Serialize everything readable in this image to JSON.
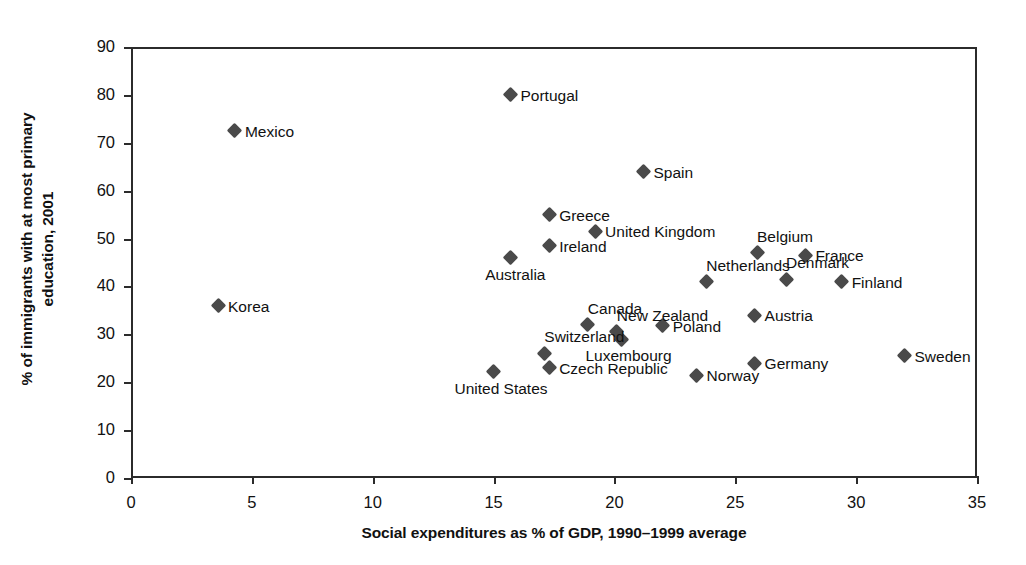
{
  "chart_data": {
    "type": "scatter",
    "title": "",
    "xlabel": "Social expenditures as % of GDP, 1990–1999 average",
    "ylabel": "% of immigrants with at most primary\neducation, 2001",
    "xlim": [
      0,
      35
    ],
    "ylim": [
      0,
      90
    ],
    "xticks": [
      "0",
      "5",
      "10",
      "15",
      "20",
      "25",
      "30",
      "35"
    ],
    "yticks": [
      "0",
      "10",
      "20",
      "30",
      "40",
      "50",
      "60",
      "70",
      "80",
      "90"
    ],
    "xtick_step": 5,
    "ytick_step": 10,
    "grid": false,
    "legend": "none",
    "marker_color": "#4a4a4a",
    "axis_color": "#2b2b2b",
    "points": [
      {
        "label": "Portugal",
        "x": 15.7,
        "y": 80.0,
        "label_pos": "right"
      },
      {
        "label": "Mexico",
        "x": 4.3,
        "y": 72.5,
        "label_pos": "right"
      },
      {
        "label": "Spain",
        "x": 21.2,
        "y": 64.0,
        "label_pos": "right"
      },
      {
        "label": "Greece",
        "x": 17.3,
        "y": 55.0,
        "label_pos": "right"
      },
      {
        "label": "United Kingdom",
        "x": 19.2,
        "y": 51.5,
        "label_pos": "right"
      },
      {
        "label": "Ireland",
        "x": 17.3,
        "y": 48.5,
        "label_pos": "right"
      },
      {
        "label": "Belgium",
        "x": 25.9,
        "y": 47.0,
        "label_pos": "above"
      },
      {
        "label": "France",
        "x": 27.9,
        "y": 46.5,
        "label_pos": "right"
      },
      {
        "label": "Australia",
        "x": 15.7,
        "y": 46.0,
        "label_pos": "below"
      },
      {
        "label": "Denmark",
        "x": 27.1,
        "y": 41.5,
        "label_pos": "above"
      },
      {
        "label": "Netherlands",
        "x": 23.8,
        "y": 41.0,
        "label_pos": "above"
      },
      {
        "label": "Finland",
        "x": 29.4,
        "y": 41.0,
        "label_pos": "right"
      },
      {
        "label": "Korea",
        "x": 3.6,
        "y": 36.0,
        "label_pos": "right"
      },
      {
        "label": "Austria",
        "x": 25.8,
        "y": 34.0,
        "label_pos": "right"
      },
      {
        "label": "Canada",
        "x": 18.9,
        "y": 32.0,
        "label_pos": "above"
      },
      {
        "label": "Poland",
        "x": 22.0,
        "y": 31.8,
        "label_pos": "right"
      },
      {
        "label": "New Zealand",
        "x": 20.1,
        "y": 30.5,
        "label_pos": "above"
      },
      {
        "label": "Luxembourg",
        "x": 20.3,
        "y": 29.0,
        "label_pos": "below"
      },
      {
        "label": "Switzerland",
        "x": 17.1,
        "y": 26.0,
        "label_pos": "above"
      },
      {
        "label": "Sweden",
        "x": 32.0,
        "y": 25.5,
        "label_pos": "right"
      },
      {
        "label": "Germany",
        "x": 25.8,
        "y": 24.0,
        "label_pos": "right"
      },
      {
        "label": "Czech Republic",
        "x": 17.3,
        "y": 23.0,
        "label_pos": "right"
      },
      {
        "label": "United States",
        "x": 15.0,
        "y": 22.2,
        "label_pos": "below"
      },
      {
        "label": "Norway",
        "x": 23.4,
        "y": 21.5,
        "label_pos": "right"
      }
    ]
  }
}
